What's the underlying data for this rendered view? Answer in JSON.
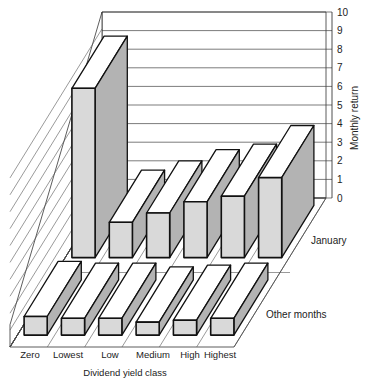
{
  "chart_data": {
    "type": "bar",
    "style": "3d-grouped",
    "title": "",
    "categories": [
      "Zero",
      "Lowest",
      "Low",
      "Medium",
      "High",
      "Highest"
    ],
    "series": [
      {
        "name": "January",
        "values": [
          9.1,
          1.9,
          2.4,
          3.0,
          3.3,
          4.3
        ]
      },
      {
        "name": "Other months",
        "values": [
          1.0,
          0.9,
          0.9,
          0.7,
          0.8,
          0.9
        ]
      }
    ],
    "xlabel": "Dividend yield class",
    "ylabel": "Monthly return",
    "ylim": [
      0,
      10
    ],
    "yticks": [
      0,
      1,
      2,
      3,
      4,
      5,
      6,
      7,
      8,
      9,
      10
    ],
    "grid": true,
    "legend": "row labels at right of each depth row"
  },
  "colors": {
    "bar_front": "#d9d9d9",
    "bar_side": "#b3b3b3",
    "bar_top": "#ffffff",
    "outline": "#111111",
    "grid": "#444444"
  }
}
